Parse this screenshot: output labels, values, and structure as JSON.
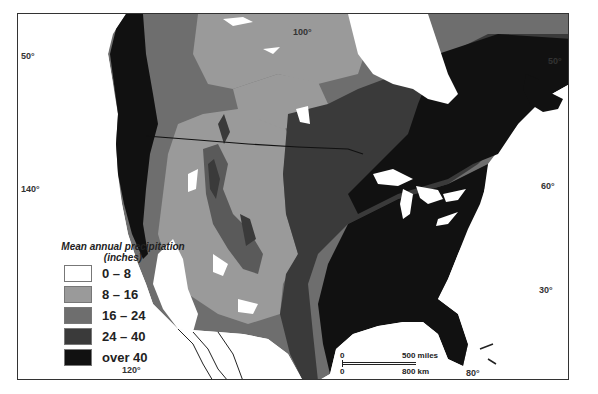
{
  "map": {
    "title": "Mean annual precipitation, North America",
    "colors": {
      "0-8": "#ffffff",
      "8-16": "#9a9a9a",
      "16-24": "#6e6e6e",
      "24-40": "#3a3a3a",
      "over-40": "#111111",
      "water": "#ffffff",
      "outline": "#222222"
    },
    "coordinates": {
      "lat_50_left": "50°",
      "lon_100_top": "100°",
      "lat_50_right": "50°",
      "lon_140_left": "140°",
      "lat_60_right": "60°",
      "lat_30_right": "30°",
      "lon_120_bottom": "120°",
      "lon_80_bottom": "80°"
    }
  },
  "legend": {
    "title": "Mean annual precipitation (inches)",
    "items": [
      {
        "label": "0 – 8",
        "color": "#ffffff"
      },
      {
        "label": "8 – 16",
        "color": "#9a9a9a"
      },
      {
        "label": "16 – 24",
        "color": "#6e6e6e"
      },
      {
        "label": "24 – 40",
        "color": "#3a3a3a"
      },
      {
        "label": "over  40",
        "color": "#111111"
      }
    ]
  },
  "scale_bar": {
    "zero_top": "0",
    "zero_bottom": "0",
    "miles_label": "500 miles",
    "km_label": "800 km"
  }
}
